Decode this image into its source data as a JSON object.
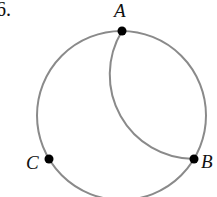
{
  "problem": {
    "number": "6."
  },
  "points": [
    {
      "label": "A",
      "x": 122,
      "y": 31
    },
    {
      "label": "B",
      "x": 194,
      "y": 159
    },
    {
      "label": "C",
      "x": 49,
      "y": 159
    }
  ],
  "circle": {
    "cx": 121.5,
    "cy": 115.5,
    "r": 84.5,
    "stroke": "#8a8a8a"
  },
  "inner_arc": {
    "from": "A",
    "to": "B",
    "cx": 194,
    "cy": 74.75,
    "r": 84.25,
    "stroke": "#8a8a8a"
  },
  "colors": {
    "point": "#000000",
    "line": "#8a8a8a"
  }
}
